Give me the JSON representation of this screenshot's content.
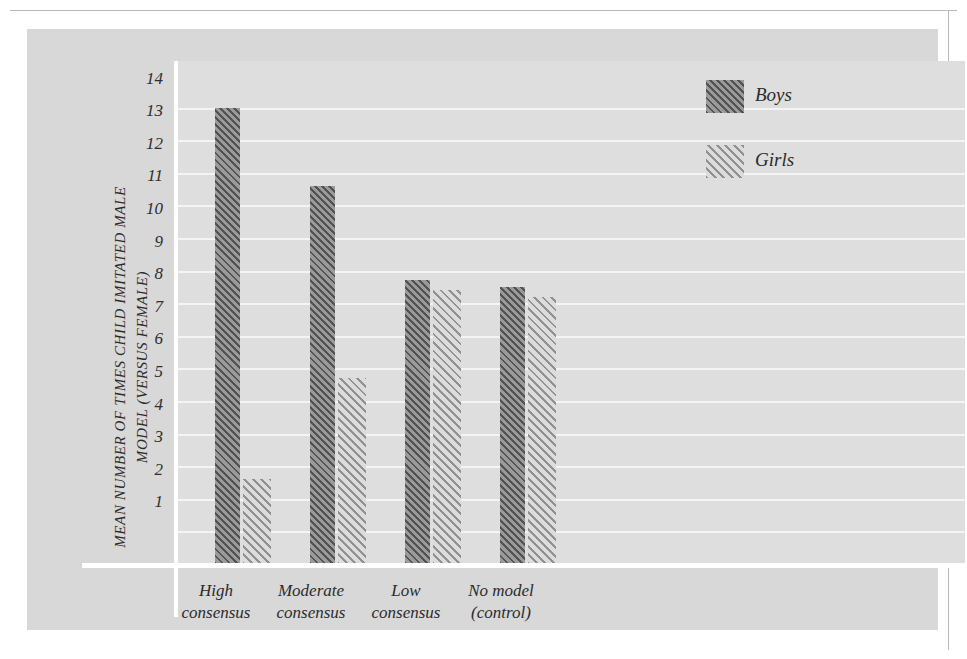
{
  "chart_data": {
    "type": "bar",
    "title": "",
    "xlabel": "",
    "ylabel": "MEAN NUMBER OF TIMES CHILD IMITATED MALE MODEL (VERSUS FEMALE)",
    "categories": [
      "High consensus",
      "Moderate consensus",
      "Low consensus",
      "No model (control)"
    ],
    "category_lines": [
      [
        "High",
        "consensus"
      ],
      [
        "Moderate",
        "consensus"
      ],
      [
        "Low",
        "consensus"
      ],
      [
        "No model",
        "(control)"
      ]
    ],
    "series": [
      {
        "name": "Boys",
        "values": [
          14.0,
          11.6,
          8.7,
          8.5
        ]
      },
      {
        "name": "Girls",
        "values": [
          2.6,
          5.7,
          8.4,
          8.2
        ]
      }
    ],
    "ylim": [
      0,
      14.6
    ],
    "yticks": [
      14,
      13,
      12,
      11,
      10,
      9,
      8,
      7,
      6,
      5,
      4,
      3,
      2,
      1
    ],
    "ytick_labels": [
      "14",
      "13",
      "12",
      "11",
      "10",
      "9",
      "8",
      "7",
      "6",
      "5",
      "4",
      "3",
      "2",
      "1"
    ],
    "grid": true,
    "legend_position": "top-right",
    "colors": {
      "boys_fill": "#9a9a9a",
      "boys_hatch": "#464646",
      "girls_fill": "#dcdcdc",
      "girls_hatch": "#787878",
      "panel_background": "#d8d8d8",
      "plot_background": "#dedede",
      "gridline": "#f4f4f4",
      "axis_line": "#ffffff",
      "text": "#2b2b2b"
    }
  },
  "legend": {
    "items": [
      {
        "label": "Boys"
      },
      {
        "label": "Girls"
      }
    ]
  }
}
